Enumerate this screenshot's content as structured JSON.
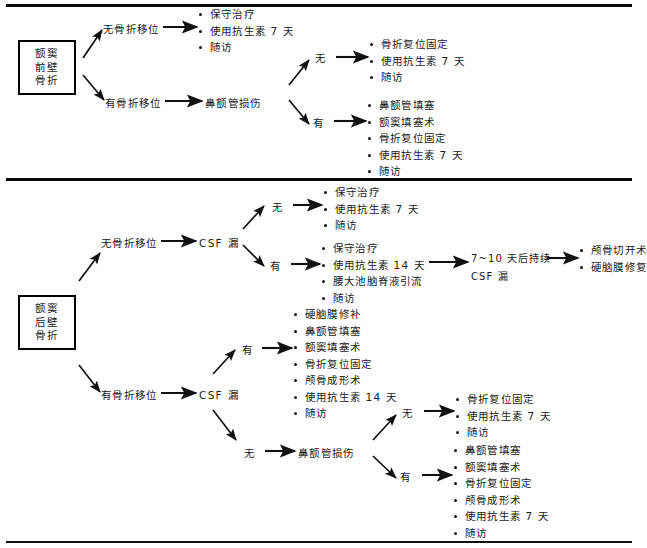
{
  "figure": {
    "title_visible": false,
    "divider_count": 3
  },
  "section_top": {
    "root": {
      "lines": [
        "额窦",
        "前壁",
        "骨折"
      ]
    },
    "branch_nodisplace": {
      "label": "无骨折移位",
      "outcomes": [
        "保守治疗",
        "使用抗生素 7 天",
        "随访"
      ]
    },
    "branch_displace": {
      "label": "有骨折移位",
      "next": "鼻额管损伤",
      "sub_no": {
        "label": "无",
        "outcomes": [
          "骨折复位固定",
          "使用抗生素 7 天",
          "随访"
        ]
      },
      "sub_yes": {
        "label": "有",
        "outcomes": [
          "鼻额管填塞",
          "额窦填塞术",
          "骨折复位固定",
          "使用抗生素 7 天",
          "随访"
        ]
      }
    }
  },
  "section_bottom": {
    "root": {
      "lines": [
        "额窦",
        "后壁",
        "骨折"
      ]
    },
    "branch_nodisplace": {
      "label": "无骨折移位",
      "next": "CSF 漏",
      "sub_no": {
        "label": "无",
        "outcomes": [
          "保守治疗",
          "使用抗生素 7 天",
          "随访"
        ]
      },
      "sub_yes": {
        "label": "有",
        "outcomes": [
          "保守治疗",
          "使用抗生素 14 天",
          "腰大池脑脊液引流",
          "随访"
        ],
        "followup_condition_line1": "7~10 天后持续",
        "followup_condition_line2": "CSF 漏",
        "followup_outcomes": [
          "颅骨切开术",
          "硬脑膜修复"
        ]
      }
    },
    "branch_displace": {
      "label": "有骨折移位",
      "next": "CSF 漏",
      "sub_yes": {
        "label": "有",
        "outcomes": [
          "硬脑膜修补",
          "鼻额管填塞",
          "额窦填塞术",
          "骨折复位固定",
          "颅骨成形术",
          "使用抗生素 14 天",
          "随访"
        ]
      },
      "sub_no": {
        "label": "无",
        "next": "鼻额管损伤",
        "leaf_no": {
          "label": "无",
          "outcomes": [
            "骨折复位固定",
            "使用抗生素 7 天",
            "随访"
          ]
        },
        "leaf_yes": {
          "label": "有",
          "outcomes": [
            "鼻额管填塞",
            "额窦填塞术",
            "骨折复位固定",
            "颅骨成形术",
            "使用抗生素 7 天",
            "随访"
          ]
        }
      }
    }
  },
  "colors": {
    "ink": "#1a1a1a",
    "rule": "#0a0a0a",
    "paper": "#ffffff"
  }
}
